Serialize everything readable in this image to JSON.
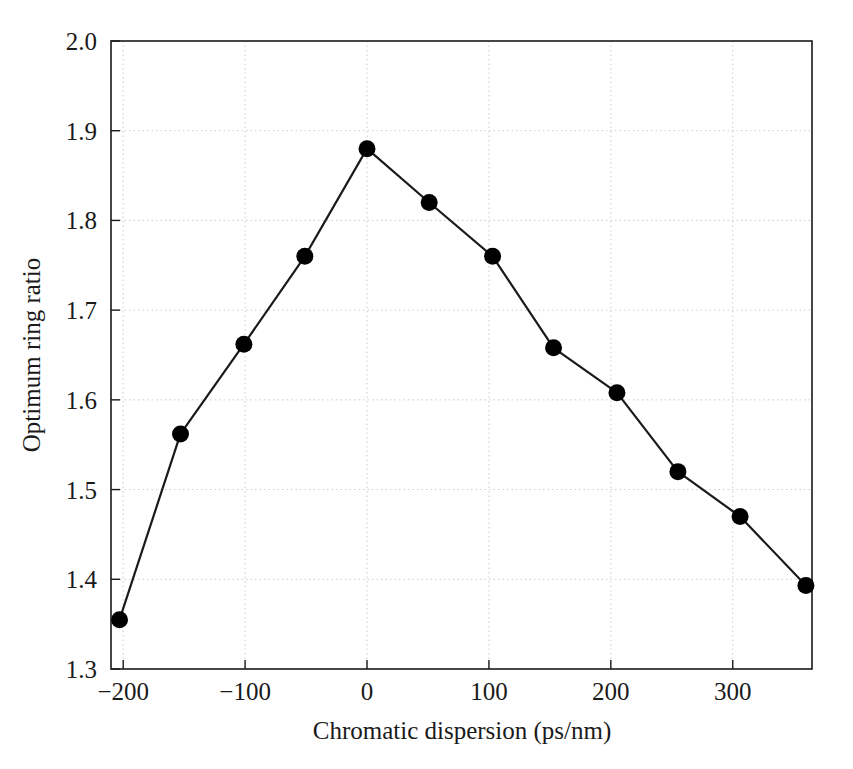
{
  "chart_data": {
    "type": "line",
    "title": "",
    "xlabel": "Chromatic dispersion (ps/nm)",
    "ylabel": "Optimum ring ratio",
    "xlim": [
      -210,
      365
    ],
    "ylim": [
      1.3,
      2.0
    ],
    "xticks": [
      -200,
      -100,
      0,
      100,
      200,
      300
    ],
    "xtick_labels": [
      "−200",
      "−100",
      "0",
      "100",
      "200",
      "300"
    ],
    "yticks": [
      1.3,
      1.4,
      1.5,
      1.6,
      1.7,
      1.8,
      1.9,
      2.0
    ],
    "ytick_labels": [
      "1.3",
      "1.4",
      "1.5",
      "1.6",
      "1.7",
      "1.8",
      "1.9",
      "2.0"
    ],
    "grid": true,
    "grid_style": "dotted",
    "grid_color": "#cccccc",
    "legend": null,
    "legend_position": "none",
    "line_color": "#1a1a1a",
    "marker_color": "#000000",
    "marker": "circle",
    "x": [
      -203,
      -153,
      -101,
      -51,
      0,
      51,
      103,
      153,
      205,
      255,
      306,
      360
    ],
    "y": [
      1.355,
      1.562,
      1.662,
      1.76,
      1.88,
      1.82,
      1.76,
      1.658,
      1.608,
      1.52,
      1.47,
      1.393
    ],
    "series": [
      {
        "name": "Optimum ring ratio",
        "points": [
          {
            "x": -203,
            "y": 1.355
          },
          {
            "x": -153,
            "y": 1.562
          },
          {
            "x": -101,
            "y": 1.662
          },
          {
            "x": -51,
            "y": 1.76
          },
          {
            "x": 0,
            "y": 1.88
          },
          {
            "x": 51,
            "y": 1.82
          },
          {
            "x": 103,
            "y": 1.76
          },
          {
            "x": 153,
            "y": 1.658
          },
          {
            "x": 205,
            "y": 1.608
          },
          {
            "x": 255,
            "y": 1.52
          },
          {
            "x": 306,
            "y": 1.47
          },
          {
            "x": 360,
            "y": 1.393
          }
        ]
      }
    ]
  }
}
